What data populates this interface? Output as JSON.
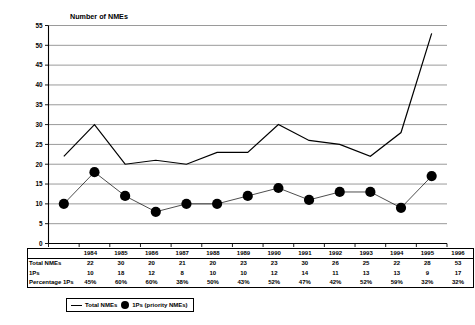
{
  "chart_data": {
    "type": "line",
    "title": "Number of NMEs",
    "xlabel": "",
    "ylabel": "Number of NMEs",
    "ylim": [
      0,
      55
    ],
    "ytick_step": 5,
    "yticks": [
      0,
      5,
      10,
      15,
      20,
      25,
      30,
      35,
      40,
      45,
      50,
      55
    ],
    "grid": true,
    "legend_position": "bottom",
    "categories": [
      "1984",
      "1985",
      "1986",
      "1987",
      "1988",
      "1989",
      "1990",
      "1991",
      "1992",
      "1993",
      "1994",
      "1995",
      "1996"
    ],
    "series": [
      {
        "name": "Total NMEs",
        "marker": "none",
        "values": [
          22,
          30,
          20,
          21,
          20,
          23,
          23,
          30,
          26,
          25,
          22,
          28,
          53
        ]
      },
      {
        "name": "1Ps (priority NMEs)",
        "marker": "filled-circle",
        "values": [
          10,
          18,
          12,
          8,
          10,
          10,
          12,
          14,
          11,
          13,
          13,
          9,
          17
        ]
      }
    ],
    "percentages": [
      "45%",
      "60%",
      "60%",
      "38%",
      "50%",
      "43%",
      "52%",
      "47%",
      "42%",
      "52%",
      "59%",
      "32%",
      "32%"
    ]
  },
  "table": {
    "row_labels": [
      "Total NMEs",
      "1Ps",
      "Percentage 1Ps"
    ],
    "years": [
      "1984",
      "1985",
      "1986",
      "1987",
      "1988",
      "1989",
      "1990",
      "1991",
      "1992",
      "1993",
      "1994",
      "1995",
      "1996"
    ],
    "total_nmes": [
      "22",
      "30",
      "20",
      "21",
      "20",
      "23",
      "23",
      "30",
      "26",
      "25",
      "22",
      "28",
      "53"
    ],
    "ips": [
      "10",
      "18",
      "12",
      "8",
      "10",
      "10",
      "12",
      "14",
      "11",
      "13",
      "13",
      "9",
      "17"
    ],
    "percentage_ips": [
      "45%",
      "60%",
      "60%",
      "38%",
      "50%",
      "43%",
      "52%",
      "47%",
      "42%",
      "52%",
      "59%",
      "32%",
      "32%"
    ]
  },
  "legend": {
    "total_label": "Total NMEs",
    "ip_label": "1Ps (priority NMEs)"
  },
  "colors": {
    "line": "#000000",
    "grid": "#6e6e6e",
    "background": "#ffffff"
  }
}
